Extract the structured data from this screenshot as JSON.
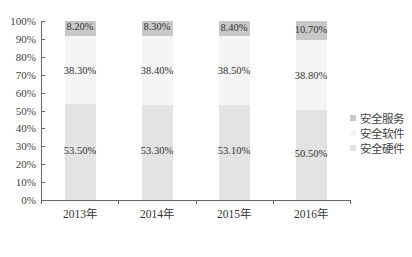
{
  "chart_data": {
    "type": "bar",
    "stacked": true,
    "percent": true,
    "title": "",
    "xlabel": "",
    "ylabel": "",
    "ylim": [
      0,
      100
    ],
    "yticks": [
      "0%",
      "10%",
      "20%",
      "30%",
      "40%",
      "50%",
      "60%",
      "70%",
      "80%",
      "90%",
      "100%"
    ],
    "categories": [
      "2013年",
      "2014年",
      "2015年",
      "2016年"
    ],
    "series": [
      {
        "name": "安全硬件",
        "values": [
          53.5,
          53.3,
          53.1,
          50.5
        ],
        "labels": [
          "53.50%",
          "53.30%",
          "53.10%",
          "50.50%"
        ],
        "color": "#e3e3e3"
      },
      {
        "name": "安全软件",
        "values": [
          38.3,
          38.4,
          38.5,
          38.8
        ],
        "labels": [
          "38.30%",
          "38.40%",
          "38.50%",
          "38.80%"
        ],
        "color": "#f5f5f5"
      },
      {
        "name": "安全服务",
        "values": [
          8.2,
          8.3,
          8.4,
          10.7
        ],
        "labels": [
          "8.20%",
          "8.30%",
          "8.40%",
          "10.70%"
        ],
        "color": "#c8c8c8"
      }
    ],
    "legend": {
      "position": "right",
      "entries": [
        "安全服务",
        "安全软件",
        "安全硬件"
      ]
    },
    "grid": false
  }
}
